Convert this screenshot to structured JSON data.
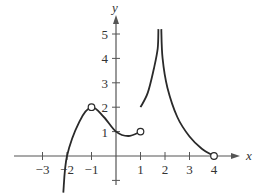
{
  "chart_data": {
    "type": "line",
    "title": "",
    "xlabel": "x",
    "ylabel": "y",
    "xlim": [
      -4,
      5
    ],
    "ylim": [
      -1.5,
      5.5
    ],
    "grid": false,
    "x_ticks": [
      {
        "value": -3,
        "label": "−3"
      },
      {
        "value": -2,
        "label": "−2"
      },
      {
        "value": -1,
        "label": "−1"
      },
      {
        "value": 1,
        "label": "1"
      },
      {
        "value": 2,
        "label": "2"
      },
      {
        "value": 3,
        "label": "3"
      },
      {
        "value": 4,
        "label": "4"
      }
    ],
    "y_ticks": [
      {
        "value": 1,
        "label": "1"
      },
      {
        "value": 2,
        "label": "2"
      },
      {
        "value": 3,
        "label": "3"
      },
      {
        "value": 4,
        "label": "4"
      },
      {
        "value": 5,
        "label": "5"
      }
    ],
    "y_ticks_unlabeled": [
      -1
    ],
    "series": [
      {
        "name": "piece-1",
        "description": "curve rising through (-2,0) to a local max at (-1,2), falling to (0,1), min near (0.5,0.8), ending at (1,1)",
        "points": [
          [
            -2.15,
            -1.5
          ],
          [
            -2,
            0
          ],
          [
            -1.5,
            1.4
          ],
          [
            -1,
            2
          ],
          [
            -0.5,
            1.6
          ],
          [
            0,
            1
          ],
          [
            0.5,
            0.82
          ],
          [
            1,
            1
          ]
        ],
        "open_points": [
          [
            -1,
            2
          ],
          [
            1,
            1
          ]
        ],
        "closed_points": []
      },
      {
        "name": "piece-2",
        "description": "starts at (1,2) and rises to vertical asymptote near x=1.75",
        "points": [
          [
            1,
            2
          ],
          [
            1.3,
            2.6
          ],
          [
            1.55,
            3.6
          ],
          [
            1.7,
            4.4
          ],
          [
            1.73,
            5.2
          ]
        ],
        "open_points": [],
        "closed_points": []
      },
      {
        "name": "piece-3",
        "description": "descends from vertical asymptote near x=1.85 to (4,0)",
        "points": [
          [
            1.85,
            5.2
          ],
          [
            1.9,
            4.0
          ],
          [
            2.1,
            2.8
          ],
          [
            2.5,
            1.6
          ],
          [
            3,
            0.8
          ],
          [
            3.5,
            0.3
          ],
          [
            4,
            0
          ]
        ],
        "open_points": [
          [
            4,
            0
          ]
        ],
        "closed_points": []
      }
    ],
    "annotations": []
  },
  "colors": {
    "curve": "#2a2a2a",
    "axis": "#555555",
    "text": "#333333"
  }
}
